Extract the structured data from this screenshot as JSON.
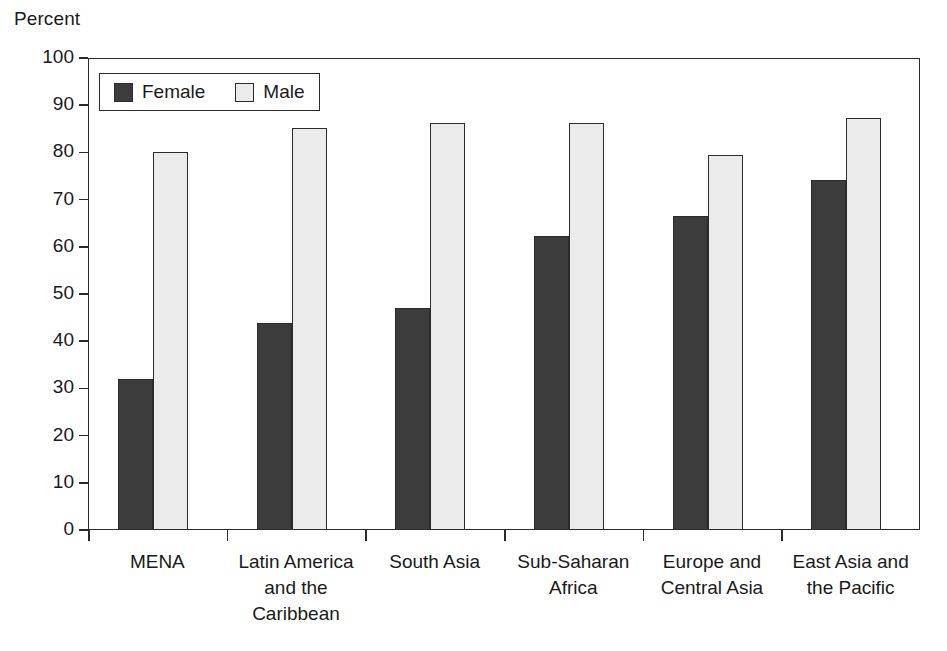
{
  "chart_data": {
    "type": "bar",
    "title": "",
    "subtitle": "",
    "xlabel": "",
    "ylabel": "Percent",
    "ylim": [
      0,
      100
    ],
    "yticks": [
      0,
      10,
      20,
      30,
      40,
      50,
      60,
      70,
      80,
      90,
      100
    ],
    "ytick_labels": [
      "0",
      "10",
      "20",
      "30",
      "40",
      "50",
      "60",
      "70",
      "80",
      "90",
      "100"
    ],
    "grid": false,
    "legend_position": "upper-left-inside",
    "categories": [
      "MENA",
      "Latin America and the Caribbean",
      "South Asia",
      "Sub-Saharan Africa",
      "Europe and Central Asia",
      "East Asia and the Pacific"
    ],
    "category_label_lines": [
      [
        "MENA"
      ],
      [
        "Latin America",
        "and the",
        "Caribbean"
      ],
      [
        "South Asia"
      ],
      [
        "Sub-Saharan",
        "Africa"
      ],
      [
        "Europe and",
        "Central Asia"
      ],
      [
        "East Asia and",
        "the Pacific"
      ]
    ],
    "series": [
      {
        "name": "Female",
        "color": "#3c3c3c",
        "values": [
          32,
          43.8,
          47,
          62.2,
          66.5,
          74.2
        ]
      },
      {
        "name": "Male",
        "color": "#ebebeb",
        "values": [
          80,
          85.1,
          86.3,
          86.2,
          79.5,
          87.2
        ]
      }
    ],
    "annotations": []
  },
  "legend": {
    "items": [
      {
        "label": "Female",
        "swatch": "female-swatch"
      },
      {
        "label": "Male",
        "swatch": "male-swatch"
      }
    ]
  },
  "colors": {
    "female_fill": "#3c3c3c",
    "male_fill": "#ebebeb",
    "outline": "#2b2b2b",
    "text": "#1a1a1a",
    "background": "#ffffff"
  }
}
